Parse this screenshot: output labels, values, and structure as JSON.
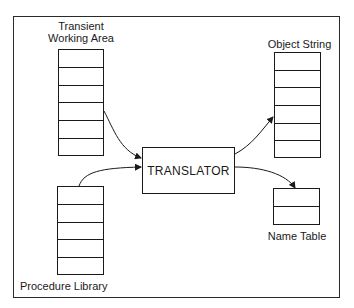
{
  "diagram": {
    "nodes": {
      "transient_working_area": {
        "label_line1": "Transient",
        "label_line2": "Working Area",
        "rows": 6
      },
      "procedure_library": {
        "label": "Procedure Library",
        "rows": 5
      },
      "translator": {
        "label": "TRANSLATOR"
      },
      "object_string": {
        "label": "Object String",
        "rows": 6
      },
      "name_table": {
        "label": "Name Table",
        "rows": 2
      }
    },
    "edges": [
      {
        "from": "Transient Working Area",
        "to": "TRANSLATOR"
      },
      {
        "from": "Procedure Library",
        "to": "TRANSLATOR"
      },
      {
        "from": "TRANSLATOR",
        "to": "Object String"
      },
      {
        "from": "TRANSLATOR",
        "to": "Name Table"
      }
    ]
  }
}
